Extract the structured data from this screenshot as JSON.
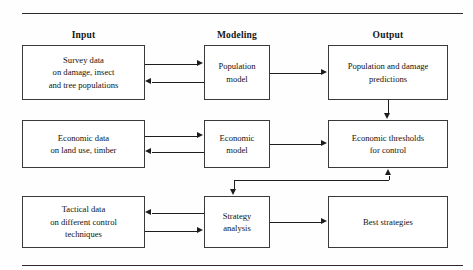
{
  "figure": {
    "line_color": "#1d1d1d",
    "box_border_color": "#3a3a3a",
    "background": "#ffffff"
  },
  "columns": [
    {
      "id": "input",
      "label": "Input"
    },
    {
      "id": "modeling",
      "label": "Modeling"
    },
    {
      "id": "output",
      "label": "Output"
    }
  ],
  "boxes": [
    {
      "id": "survey-data",
      "column": "input",
      "row": 1,
      "lines": [
        "Survey data",
        "on damage, insect",
        "and tree populations"
      ]
    },
    {
      "id": "population-model",
      "column": "modeling",
      "row": 1,
      "lines": [
        "Population",
        "model"
      ]
    },
    {
      "id": "population-damage-predictions",
      "column": "output",
      "row": 1,
      "lines": [
        "Population and damage",
        "predictions"
      ]
    },
    {
      "id": "economic-data",
      "column": "input",
      "row": 2,
      "lines": [
        "Economic data",
        "on land use, timber"
      ]
    },
    {
      "id": "economic-model",
      "column": "modeling",
      "row": 2,
      "lines": [
        "Economic",
        "model"
      ]
    },
    {
      "id": "economic-thresholds",
      "column": "output",
      "row": 2,
      "lines": [
        "Economic thresholds",
        "for control"
      ]
    },
    {
      "id": "tactical-data",
      "column": "input",
      "row": 3,
      "lines": [
        "Tactical data",
        "on different control",
        "techniques"
      ]
    },
    {
      "id": "strategy-analysis",
      "column": "modeling",
      "row": 3,
      "lines": [
        "Strategy",
        "analysis"
      ]
    },
    {
      "id": "best-strategies",
      "column": "output",
      "row": 3,
      "lines": [
        "Best strategies"
      ]
    }
  ],
  "connectors": [
    {
      "id": "survey-to-population-model",
      "from": "survey-data",
      "to": "population-model",
      "direction": "right"
    },
    {
      "id": "population-model-to-survey",
      "from": "population-model",
      "to": "survey-data",
      "direction": "left"
    },
    {
      "id": "population-model-to-predictions",
      "from": "population-model",
      "to": "population-damage-predictions",
      "direction": "right"
    },
    {
      "id": "predictions-to-thresholds",
      "from": "population-damage-predictions",
      "to": "economic-thresholds",
      "direction": "down"
    },
    {
      "id": "economic-data-to-economic-model",
      "from": "economic-data",
      "to": "economic-model",
      "direction": "right"
    },
    {
      "id": "economic-model-to-economic-data",
      "from": "economic-model",
      "to": "economic-data",
      "direction": "left"
    },
    {
      "id": "economic-model-to-thresholds",
      "from": "economic-model",
      "to": "economic-thresholds",
      "direction": "right"
    },
    {
      "id": "thresholds-to-strategy-analysis",
      "from": "economic-thresholds",
      "to": "strategy-analysis",
      "direction": "down"
    },
    {
      "id": "strategy-analysis-to-thresholds",
      "from": "strategy-analysis",
      "to": "economic-thresholds",
      "direction": "up"
    },
    {
      "id": "strategy-analysis-to-tactical-data",
      "from": "strategy-analysis",
      "to": "tactical-data",
      "direction": "left"
    },
    {
      "id": "tactical-data-to-strategy-analysis",
      "from": "tactical-data",
      "to": "strategy-analysis",
      "direction": "right"
    },
    {
      "id": "strategy-analysis-to-best-strategies",
      "from": "strategy-analysis",
      "to": "best-strategies",
      "direction": "right"
    }
  ]
}
